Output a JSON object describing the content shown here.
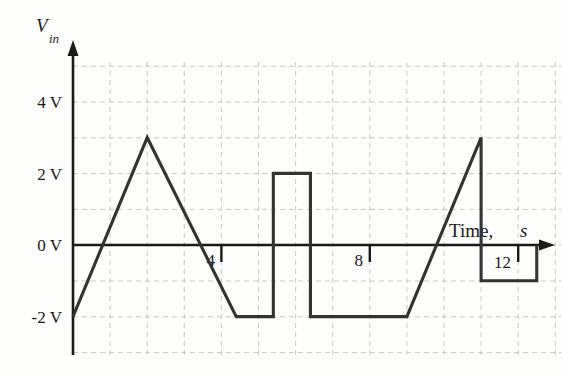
{
  "figure": {
    "background_color": "#fdfdfb",
    "trace_color": "#333333",
    "grid_color": "#c9c9cf",
    "axis_color": "#1a1a1a",
    "y_axis_label": "V",
    "y_axis_sublabel": "in",
    "x_axis_label_main": "Time,",
    "x_axis_label_unit": "s",
    "y_ticks": [
      {
        "value": 4,
        "label": "4 V"
      },
      {
        "value": 2,
        "label": "2 V"
      },
      {
        "value": 0,
        "label": "0 V"
      },
      {
        "value": -2,
        "label": "-2 V"
      }
    ],
    "x_ticks": [
      {
        "value": 4,
        "label": "4"
      },
      {
        "value": 8,
        "label": "8"
      },
      {
        "value": 12,
        "label": "12"
      }
    ]
  },
  "chart_data": {
    "type": "line",
    "title": "",
    "xlabel": "Time, s",
    "ylabel": "V_in",
    "xlim": [
      0,
      13.2
    ],
    "ylim": [
      -3,
      5
    ],
    "grid": true,
    "grid_spacing_x": 1,
    "grid_spacing_y": 1,
    "legend": "none",
    "series": [
      {
        "name": "V_in",
        "x": [
          0,
          2,
          4.4,
          5.4,
          5.4,
          6.4,
          6.4,
          7.4,
          9.0,
          11.0,
          11.0,
          12.5,
          12.5
        ],
        "y": [
          -2,
          3,
          -2,
          -2,
          2,
          2,
          -2,
          -2,
          -2,
          3,
          -1,
          -1,
          0
        ]
      }
    ],
    "annotations": [
      {
        "text": "rising ramp -2 V to 3 V over 0-2 s"
      },
      {
        "text": "falling ramp 3 V to -2 V over 2-4.4 s"
      },
      {
        "text": "hold -2 V from 4.4-5.4 s"
      },
      {
        "text": "square pulse +2 V from 5.4-6.4 s"
      },
      {
        "text": "hold -2 V from 6.4-9 s"
      },
      {
        "text": "rising ramp -2 V to 3 V over 9-11 s"
      },
      {
        "text": "drop to -1 V at 11 s, hold to 12.5 s"
      }
    ]
  }
}
